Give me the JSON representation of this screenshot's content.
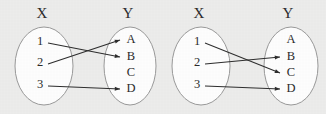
{
  "figure": {
    "background_color": "#ececeb",
    "ink_color": "#2b2b2b",
    "ellipse_stroke_color": "#9a9a9a",
    "ellipse_fill_color": "#fdfdfd",
    "diagram_count": 2
  },
  "diagrams": [
    {
      "id": "left-mapping-diagram",
      "domain": {
        "title": "X",
        "title_x": 42,
        "title_y": 15,
        "ellipse": {
          "cx": 44,
          "cy": 66,
          "rx": 29,
          "ry": 39
        },
        "elements": [
          {
            "label": "1",
            "x": 40,
            "y": 42
          },
          {
            "label": "2",
            "x": 40,
            "y": 63
          },
          {
            "label": "3",
            "x": 40,
            "y": 85
          }
        ]
      },
      "codomain": {
        "title": "Y",
        "title_x": 128,
        "title_y": 15,
        "ellipse": {
          "cx": 130,
          "cy": 66,
          "rx": 26,
          "ry": 39
        },
        "elements": [
          {
            "label": "A",
            "x": 131,
            "y": 40
          },
          {
            "label": "B",
            "x": 131,
            "y": 57
          },
          {
            "label": "C",
            "x": 131,
            "y": 73
          },
          {
            "label": "D",
            "x": 131,
            "y": 89
          }
        ]
      },
      "edges": [
        {
          "from": "1",
          "to": "B",
          "x1": 48,
          "y1": 43,
          "x2": 120,
          "y2": 57
        },
        {
          "from": "2",
          "to": "A",
          "x1": 48,
          "y1": 64,
          "x2": 120,
          "y2": 40
        },
        {
          "from": "3",
          "to": "D",
          "x1": 48,
          "y1": 86,
          "x2": 120,
          "y2": 89
        }
      ]
    },
    {
      "id": "right-mapping-diagram",
      "domain": {
        "title": "X",
        "title_x": 199,
        "title_y": 15,
        "ellipse": {
          "cx": 201,
          "cy": 66,
          "rx": 29,
          "ry": 39
        },
        "elements": [
          {
            "label": "1",
            "x": 197,
            "y": 42
          },
          {
            "label": "2",
            "x": 197,
            "y": 63
          },
          {
            "label": "3",
            "x": 197,
            "y": 85
          }
        ]
      },
      "codomain": {
        "title": "Y",
        "title_x": 288,
        "title_y": 15,
        "ellipse": {
          "cx": 291,
          "cy": 66,
          "rx": 27,
          "ry": 39
        },
        "elements": [
          {
            "label": "A",
            "x": 291,
            "y": 40
          },
          {
            "label": "B",
            "x": 291,
            "y": 57
          },
          {
            "label": "C",
            "x": 291,
            "y": 73
          },
          {
            "label": "D",
            "x": 291,
            "y": 89
          }
        ]
      },
      "edges": [
        {
          "from": "1",
          "to": "C",
          "x1": 205,
          "y1": 43,
          "x2": 280,
          "y2": 73
        },
        {
          "from": "2",
          "to": "B",
          "x1": 205,
          "y1": 64,
          "x2": 280,
          "y2": 57
        },
        {
          "from": "3",
          "to": "D",
          "x1": 205,
          "y1": 86,
          "x2": 280,
          "y2": 89
        }
      ]
    }
  ]
}
